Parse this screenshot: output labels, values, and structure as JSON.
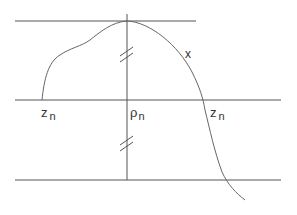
{
  "diagram": {
    "labels": {
      "z_left": {
        "main": "z",
        "sub": "n"
      },
      "rho": {
        "main": "ρ",
        "sub": "n"
      },
      "z_right": {
        "main": "z",
        "sub": "n"
      },
      "x": "x"
    },
    "line_color": "#555555",
    "curve_color": "#666666"
  }
}
